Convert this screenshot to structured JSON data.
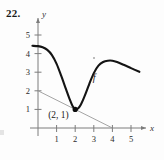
{
  "exercise": {
    "number": "22."
  },
  "chart_data": {
    "type": "line",
    "title": "",
    "xlabel": "x",
    "ylabel": "y",
    "xlim": [
      -0.35,
      5.8
    ],
    "ylim": [
      -0.5,
      5.9
    ],
    "xticks": [
      1,
      2,
      3,
      4,
      5
    ],
    "xtick_labels": [
      "1",
      "2",
      "3",
      "4",
      "5"
    ],
    "yticks": [
      1,
      2,
      3,
      4,
      5
    ],
    "ytick_labels": [
      "1",
      "2",
      "3",
      "4",
      "5"
    ],
    "grid": false,
    "legend": null,
    "series": [
      {
        "name": "f",
        "label": "f",
        "color": "#141414",
        "points": [
          [
            -0.3,
            4.42
          ],
          [
            0.0,
            4.4
          ],
          [
            0.25,
            4.34
          ],
          [
            0.5,
            4.2
          ],
          [
            0.75,
            3.92
          ],
          [
            1.0,
            3.45
          ],
          [
            1.25,
            2.8
          ],
          [
            1.5,
            2.1
          ],
          [
            1.7,
            1.55
          ],
          [
            1.85,
            1.2
          ],
          [
            2.0,
            1.0
          ],
          [
            2.15,
            1.05
          ],
          [
            2.3,
            1.25
          ],
          [
            2.5,
            1.7
          ],
          [
            2.75,
            2.35
          ],
          [
            3.0,
            2.95
          ],
          [
            3.25,
            3.35
          ],
          [
            3.5,
            3.55
          ],
          [
            3.75,
            3.62
          ],
          [
            4.0,
            3.62
          ],
          [
            4.25,
            3.55
          ],
          [
            4.6,
            3.4
          ],
          [
            5.0,
            3.22
          ],
          [
            5.45,
            3.02
          ]
        ]
      },
      {
        "name": "tangent",
        "label": "",
        "color": "#9a9a9a",
        "points": [
          [
            0.0,
            2.0
          ],
          [
            4.0,
            0.0
          ]
        ]
      }
    ],
    "annotations": [
      {
        "name": "tangent-point",
        "label": "(2, 1)",
        "x": 2,
        "y": 1,
        "marker": "filled-dot"
      },
      {
        "name": "function-label",
        "label": "f",
        "x": 2.95,
        "y": 2.55
      }
    ]
  }
}
